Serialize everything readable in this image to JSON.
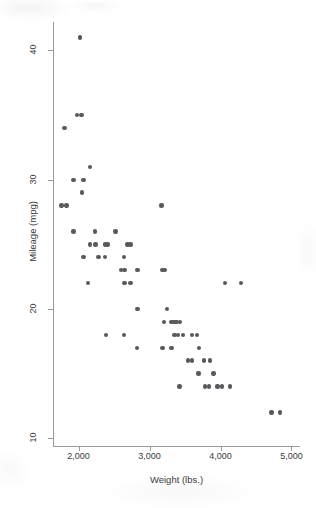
{
  "chart_data": {
    "type": "scatter",
    "title": "",
    "xlabel": "Weight (lbs.)",
    "ylabel": "Mileage (mpg)",
    "xlim": [
      1640,
      5120
    ],
    "ylim": [
      9.4,
      42.2
    ],
    "xticks": [
      2000,
      3000,
      4000,
      5000
    ],
    "xticklabels": [
      "2,000",
      "3,000",
      "4,000",
      "5,000"
    ],
    "yticks": [
      10,
      20,
      30,
      40
    ],
    "yticklabels": [
      "10",
      "20",
      "30",
      "40"
    ],
    "grid": false,
    "legend": null,
    "marker_color": "#57595d",
    "axis_color": "#9a9a9e",
    "background": "#ffffff",
    "points": [
      {
        "x": 2020,
        "y": 41
      },
      {
        "x": 1980,
        "y": 35
      },
      {
        "x": 2040,
        "y": 35
      },
      {
        "x": 1800,
        "y": 34
      },
      {
        "x": 2160,
        "y": 31
      },
      {
        "x": 1930,
        "y": 30
      },
      {
        "x": 2070,
        "y": 30
      },
      {
        "x": 2050,
        "y": 29
      },
      {
        "x": 1760,
        "y": 28
      },
      {
        "x": 1830,
        "y": 28
      },
      {
        "x": 3170,
        "y": 28
      },
      {
        "x": 1930,
        "y": 26
      },
      {
        "x": 2230,
        "y": 26
      },
      {
        "x": 2520,
        "y": 26
      },
      {
        "x": 2160,
        "y": 25
      },
      {
        "x": 2240,
        "y": 25
      },
      {
        "x": 2370,
        "y": 25
      },
      {
        "x": 2410,
        "y": 25
      },
      {
        "x": 2690,
        "y": 25
      },
      {
        "x": 2730,
        "y": 25
      },
      {
        "x": 2070,
        "y": 24
      },
      {
        "x": 2280,
        "y": 24
      },
      {
        "x": 2370,
        "y": 24
      },
      {
        "x": 2640,
        "y": 24
      },
      {
        "x": 2600,
        "y": 23
      },
      {
        "x": 2650,
        "y": 23
      },
      {
        "x": 2830,
        "y": 23
      },
      {
        "x": 3180,
        "y": 23
      },
      {
        "x": 3220,
        "y": 23
      },
      {
        "x": 2130,
        "y": 22
      },
      {
        "x": 2650,
        "y": 22
      },
      {
        "x": 2730,
        "y": 22
      },
      {
        "x": 4060,
        "y": 22
      },
      {
        "x": 4290,
        "y": 22
      },
      {
        "x": 2830,
        "y": 20
      },
      {
        "x": 3250,
        "y": 20
      },
      {
        "x": 3200,
        "y": 19
      },
      {
        "x": 3310,
        "y": 19
      },
      {
        "x": 3350,
        "y": 19
      },
      {
        "x": 3380,
        "y": 19
      },
      {
        "x": 3430,
        "y": 19
      },
      {
        "x": 2390,
        "y": 18
      },
      {
        "x": 2640,
        "y": 18
      },
      {
        "x": 3350,
        "y": 18
      },
      {
        "x": 3400,
        "y": 18
      },
      {
        "x": 3470,
        "y": 18
      },
      {
        "x": 3600,
        "y": 18
      },
      {
        "x": 3670,
        "y": 18
      },
      {
        "x": 2820,
        "y": 17
      },
      {
        "x": 3180,
        "y": 17
      },
      {
        "x": 3310,
        "y": 17
      },
      {
        "x": 3700,
        "y": 17
      },
      {
        "x": 3540,
        "y": 16
      },
      {
        "x": 3600,
        "y": 16
      },
      {
        "x": 3770,
        "y": 16
      },
      {
        "x": 3850,
        "y": 16
      },
      {
        "x": 3690,
        "y": 15
      },
      {
        "x": 3900,
        "y": 15
      },
      {
        "x": 3420,
        "y": 14
      },
      {
        "x": 3780,
        "y": 14
      },
      {
        "x": 3840,
        "y": 14
      },
      {
        "x": 3960,
        "y": 14
      },
      {
        "x": 4020,
        "y": 14
      },
      {
        "x": 4130,
        "y": 14
      },
      {
        "x": 4720,
        "y": 12
      },
      {
        "x": 4840,
        "y": 12
      }
    ]
  }
}
